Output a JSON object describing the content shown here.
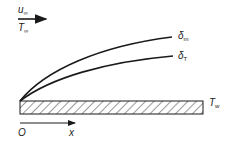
{
  "diagram": {
    "title": "",
    "free_stream": {
      "velocity_label": "u",
      "velocity_subscript": "∞",
      "temperature_label": "T",
      "temperature_subscript": "∞"
    },
    "curves": [
      {
        "name": "momentum-boundary-layer",
        "label": "δ",
        "subscript": "m"
      },
      {
        "name": "thermal-boundary-layer",
        "label": "δ",
        "subscript": "T"
      }
    ],
    "plate": {
      "label": "T",
      "subscript": "w"
    },
    "axis": {
      "origin_label": "O",
      "x_label": "x"
    },
    "colors": {
      "stroke": "#1a1a1a",
      "background": "#ffffff"
    }
  }
}
